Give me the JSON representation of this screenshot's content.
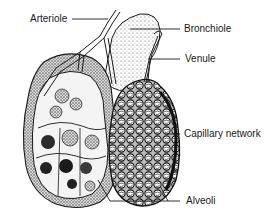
{
  "figure": {
    "colors": {
      "ink": "#1a1a1a",
      "stipple": "#555555",
      "dark_fill": "#222222",
      "background": "#ffffff"
    }
  },
  "labels": {
    "arteriole": "Arteriole",
    "bronchiole": "Bronchiole",
    "venule": "Venule",
    "capillary_network": "Capillary network",
    "alveoli": "Alveoli"
  }
}
